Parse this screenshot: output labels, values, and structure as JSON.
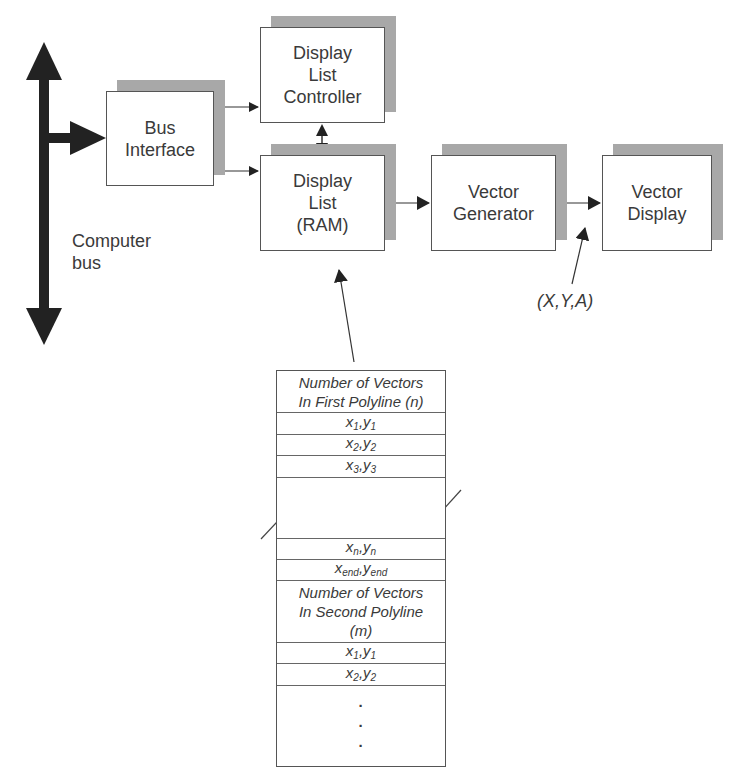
{
  "diagram": {
    "type": "block-diagram",
    "title": "",
    "blocks": {
      "bus_interface": {
        "label": "Bus\nInterface"
      },
      "display_list_controller": {
        "label": "Display\nList\nController"
      },
      "display_list_ram": {
        "label": "Display\nList\n(RAM)"
      },
      "vector_generator": {
        "label": "Vector\nGenerator"
      },
      "vector_display": {
        "label": "Vector\nDisplay"
      }
    },
    "labels": {
      "computer_bus": "Computer\nbus",
      "xya": "(X,Y,A)"
    },
    "memory_table": {
      "rows": [
        {
          "type": "header",
          "text": "Number of Vectors\nIn First Polyline (n)"
        },
        {
          "type": "coord",
          "x": "x",
          "y": "y",
          "sub": "1"
        },
        {
          "type": "coord",
          "x": "x",
          "y": "y",
          "sub": "2"
        },
        {
          "type": "coord",
          "x": "x",
          "y": "y",
          "sub": "3"
        },
        {
          "type": "gap",
          "text": ""
        },
        {
          "type": "coord",
          "x": "x",
          "y": "y",
          "sub": "n"
        },
        {
          "type": "coord",
          "x": "x",
          "y": "y",
          "sub": "end"
        },
        {
          "type": "header",
          "text": "Number of Vectors\nIn Second Polyline\n(m)"
        },
        {
          "type": "coord",
          "x": "x",
          "y": "y",
          "sub": "1"
        },
        {
          "type": "coord",
          "x": "x",
          "y": "y",
          "sub": "2"
        },
        {
          "type": "ellipsis",
          "text": "·\n·\n·"
        }
      ]
    },
    "connections": [
      {
        "from": "computer_bus",
        "to": "bus_interface",
        "style": "thick"
      },
      {
        "from": "bus_interface",
        "to": "display_list_controller"
      },
      {
        "from": "bus_interface",
        "to": "display_list_ram"
      },
      {
        "from": "display_list_controller",
        "to": "display_list_ram",
        "bidirectional": true
      },
      {
        "from": "display_list_ram",
        "to": "vector_generator"
      },
      {
        "from": "vector_generator",
        "to": "vector_display",
        "annotation": "(X,Y,A)"
      },
      {
        "from": "memory_table",
        "to": "display_list_ram"
      }
    ],
    "colors": {
      "stroke": "#333333",
      "shadow": "#a8a8a8",
      "text": "#3a3a3a",
      "bus": "#222222"
    }
  }
}
